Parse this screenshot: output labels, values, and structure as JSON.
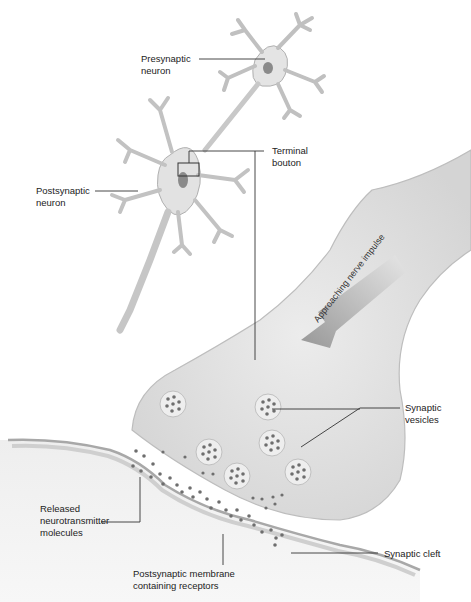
{
  "labels": {
    "presynaptic_neuron": "Presynaptic\nneuron",
    "postsynaptic_neuron": "Postsynaptic\nneuron",
    "terminal_bouton": "Terminal\nbouton",
    "approaching_nerve_impulse": "Approaching nerve impulse",
    "synaptic_vesicles": "Synaptic\nvesicles",
    "released_neurotransmitter": "Released\nneurotransmitter\nmolecules",
    "synaptic_cleft": "Synaptic cleft",
    "postsynaptic_membrane": "Postsynaptic membrane\ncontaining receptors"
  },
  "colors": {
    "cell_fill": "#e6e6e6",
    "cell_stroke": "#b5b5b5",
    "nucleus": "#8a8a8a",
    "molecule": "#6e6e6e",
    "arrow": "#9a9a9a",
    "leader_line": "#333333"
  }
}
